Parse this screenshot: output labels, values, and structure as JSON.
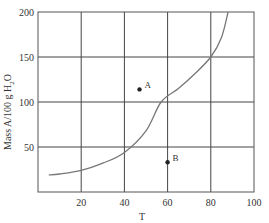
{
  "chart_data": {
    "type": "line",
    "title": "",
    "xlabel": "T",
    "ylabel": "Mass A/100 g H2O",
    "ylabel_parts": {
      "main": "Mass A/100 g H",
      "sub": "2",
      "tail": "O"
    },
    "xlim": [
      0,
      100
    ],
    "ylim": [
      0,
      200
    ],
    "x_ticks": [
      20,
      40,
      60,
      80,
      100
    ],
    "y_ticks": [
      50,
      100,
      150,
      200
    ],
    "grid": true,
    "legend": null,
    "series": [
      {
        "name": "solubility curve",
        "type": "line",
        "x": [
          5,
          10,
          20,
          30,
          40,
          50,
          57,
          65,
          72,
          80,
          85,
          88
        ],
        "y": [
          19,
          20,
          24,
          32,
          44,
          68,
          100,
          115,
          130,
          150,
          172,
          200
        ]
      }
    ],
    "points": [
      {
        "label": "A",
        "x": 47,
        "y": 114
      },
      {
        "label": "B",
        "x": 60,
        "y": 33
      }
    ],
    "colors": {
      "axis": "#555555",
      "grid": "#444444",
      "curve": "#777777",
      "points": "#222222",
      "text": "#333333"
    }
  }
}
